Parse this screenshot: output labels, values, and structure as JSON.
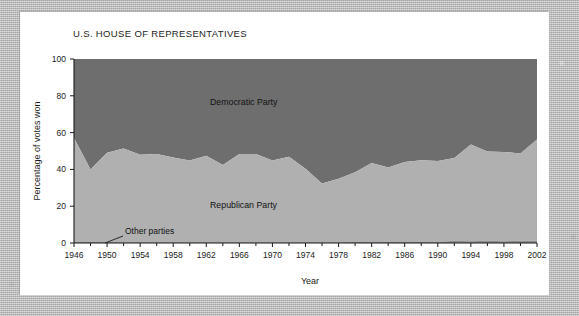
{
  "figure": {
    "title": "U.S. HOUSE OF REPRESENTATIVES",
    "xlabel": "Year",
    "ylabel": "Percentage of votes won"
  },
  "annotations": {
    "democratic_label": "Democratic Party",
    "republican_label": "Republican Party",
    "other_label": "Other parties"
  },
  "colors": {
    "democratic": "#6e6e6e",
    "republican": "#b0b0b0",
    "other": "#8c8c8c",
    "axis": "#1a1a1a",
    "card": "#ffffff",
    "page_background": "#bdbdbd"
  },
  "chart_data": {
    "type": "area",
    "stacked": true,
    "title": "U.S. HOUSE OF REPRESENTATIVES",
    "xlabel": "Year",
    "ylabel": "Percentage of votes won",
    "xlim": [
      1946,
      2002
    ],
    "ylim": [
      0,
      100
    ],
    "grid": false,
    "legend": "inline-labels",
    "x_major_ticks": [
      1946,
      1950,
      1954,
      1958,
      1962,
      1966,
      1970,
      1974,
      1978,
      1982,
      1986,
      1990,
      1994,
      1998,
      2002
    ],
    "x_minor_ticks": [
      1948,
      1952,
      1956,
      1960,
      1964,
      1968,
      1972,
      1976,
      1980,
      1984,
      1988,
      1992,
      1996,
      2000
    ],
    "y_ticks": [
      0,
      20,
      40,
      60,
      80,
      100
    ],
    "x": [
      1946,
      1948,
      1950,
      1952,
      1954,
      1956,
      1958,
      1960,
      1962,
      1964,
      1966,
      1968,
      1970,
      1972,
      1974,
      1976,
      1978,
      1980,
      1982,
      1984,
      1986,
      1988,
      1990,
      1992,
      1994,
      1996,
      1998,
      2000,
      2002
    ],
    "series": [
      {
        "name": "Other parties",
        "values": [
          0.6,
          0.5,
          0.5,
          0.4,
          0.4,
          0.4,
          0.4,
          0.4,
          0.4,
          0.4,
          0.4,
          0.4,
          0.4,
          0.4,
          0.4,
          0.4,
          0.4,
          0.5,
          0.5,
          0.5,
          0.5,
          0.5,
          0.6,
          1.2,
          1.0,
          1.2,
          1.0,
          1.2,
          1.2
        ]
      },
      {
        "name": "Republican Party",
        "values": [
          56.5,
          39.5,
          48.5,
          51.0,
          47.5,
          48.0,
          46.0,
          44.5,
          47.0,
          42.0,
          48.0,
          48.0,
          44.5,
          46.5,
          40.0,
          32.0,
          34.5,
          38.0,
          43.0,
          40.5,
          43.5,
          44.5,
          44.0,
          45.0,
          52.5,
          48.5,
          48.5,
          47.5,
          55.0
        ]
      },
      {
        "name": "Democratic Party",
        "values": [
          42.9,
          60.0,
          51.0,
          48.6,
          52.1,
          51.6,
          53.6,
          55.1,
          52.6,
          57.6,
          51.6,
          51.6,
          55.1,
          53.1,
          59.6,
          67.6,
          65.1,
          61.5,
          56.5,
          59.0,
          56.0,
          55.0,
          55.4,
          53.8,
          46.5,
          50.3,
          50.5,
          51.3,
          43.8
        ]
      }
    ]
  }
}
